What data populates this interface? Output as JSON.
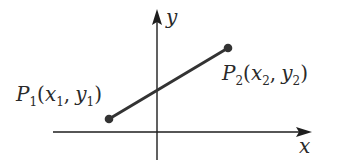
{
  "diagram": {
    "axes": {
      "x_label": "x",
      "y_label": "y"
    },
    "points": [
      {
        "name": "P",
        "subscript": "1",
        "coord_x": "x",
        "coord_x_sub": "1",
        "coord_y": "y",
        "coord_y_sub": "1",
        "open_paren": "(",
        "comma": ",",
        "close_paren": ")"
      },
      {
        "name": "P",
        "subscript": "2",
        "coord_x": "x",
        "coord_x_sub": "2",
        "coord_y": "y",
        "coord_y_sub": "2",
        "open_paren": "(",
        "comma": ",",
        "close_paren": ")"
      }
    ],
    "colors": {
      "axis": "#1e1e1e",
      "segment": "#333333",
      "point": "#333333",
      "text": "#2a2a2a",
      "background": "#ffffff"
    }
  }
}
